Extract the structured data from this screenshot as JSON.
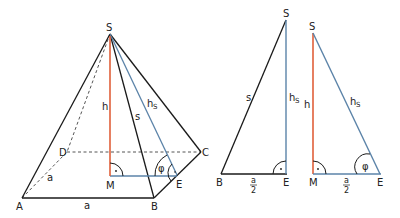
{
  "colors": {
    "edge": "#1a1a1a",
    "height": "#e0603a",
    "slant_height": "#5b83a8",
    "hidden": "#555555"
  },
  "pyramid": {
    "labels": {
      "apex": "S",
      "A": "A",
      "B": "B",
      "C": "C",
      "D": "D",
      "M": "M",
      "E": "E",
      "height": "h",
      "edge": "s",
      "slant": "h",
      "slant_sub": "S",
      "base_front": "a",
      "base_side": "a",
      "angle": "φ",
      "right_angle_dot": "·"
    }
  },
  "triangle_side": {
    "labels": {
      "apex": "S",
      "B": "B",
      "E": "E",
      "edge": "s",
      "slant": "h",
      "slant_sub": "S",
      "half_num": "a",
      "half_den": "2",
      "right_angle_dot": "·"
    }
  },
  "triangle_height": {
    "labels": {
      "apex": "S",
      "M": "M",
      "E": "E",
      "height": "h",
      "slant": "h",
      "slant_sub": "S",
      "half_num": "a",
      "half_den": "2",
      "angle": "φ",
      "right_angle_dot": "·"
    }
  }
}
